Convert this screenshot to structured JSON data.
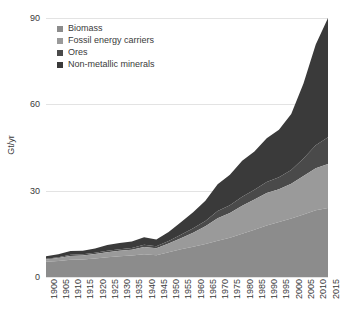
{
  "chart_data": {
    "type": "area",
    "stacked": true,
    "title": "",
    "xlabel": "",
    "ylabel": "Gt/yr",
    "ylim": [
      0,
      90
    ],
    "yticks": [
      0,
      30,
      60,
      90
    ],
    "xlim": [
      1900,
      2015
    ],
    "grid": true,
    "legend_position": "top-left",
    "x": [
      1900,
      1905,
      1910,
      1915,
      1920,
      1925,
      1930,
      1935,
      1940,
      1945,
      1950,
      1955,
      1960,
      1965,
      1970,
      1975,
      1980,
      1985,
      1990,
      1995,
      2000,
      2005,
      2010,
      2015
    ],
    "xticks": [
      "1900",
      "1905",
      "1910",
      "1915",
      "1920",
      "1925",
      "1930",
      "1935",
      "1940",
      "1945",
      "1950",
      "1955",
      "1960",
      "1965",
      "1970",
      "1975",
      "1980",
      "1985",
      "1990",
      "1995",
      "2000",
      "2005",
      "2010",
      "2015"
    ],
    "series": [
      {
        "name": "Biomass",
        "color": "#8c8c8c",
        "values": [
          5.3,
          5.6,
          6.0,
          6.1,
          6.4,
          6.9,
          7.2,
          7.5,
          7.9,
          7.6,
          8.6,
          9.6,
          10.5,
          11.5,
          12.6,
          13.6,
          15.0,
          16.4,
          17.9,
          19.1,
          20.3,
          21.7,
          23.2,
          24.0
        ]
      },
      {
        "name": "Fossil energy carriers",
        "color": "#9a9a9a",
        "values": [
          0.8,
          1.0,
          1.3,
          1.4,
          1.6,
          1.7,
          1.9,
          2.0,
          2.5,
          2.4,
          3.0,
          3.9,
          4.9,
          6.1,
          7.8,
          8.6,
          9.8,
          10.5,
          11.3,
          11.4,
          12.1,
          13.4,
          14.6,
          15.3
        ]
      },
      {
        "name": "Ores",
        "color": "#4a4a4a",
        "values": [
          0.2,
          0.3,
          0.4,
          0.4,
          0.4,
          0.5,
          0.5,
          0.6,
          0.8,
          0.7,
          0.9,
          1.2,
          1.5,
          1.9,
          2.5,
          2.7,
          3.1,
          3.4,
          3.8,
          4.2,
          4.8,
          6.1,
          8.0,
          9.3
        ]
      },
      {
        "name": "Non-metallic minerals",
        "color": "#3a3a3a",
        "values": [
          0.9,
          1.0,
          1.3,
          1.2,
          1.5,
          2.0,
          2.2,
          2.2,
          2.6,
          2.3,
          3.1,
          4.3,
          5.6,
          7.0,
          9.3,
          10.6,
          12.5,
          13.3,
          15.2,
          16.5,
          19.4,
          26.0,
          35.0,
          41.4
        ]
      }
    ],
    "totals": [
      7.2,
      7.9,
      9.0,
      9.1,
      9.9,
      11.1,
      11.8,
      12.3,
      13.8,
      13.0,
      15.6,
      19.0,
      22.5,
      26.5,
      32.2,
      35.5,
      40.4,
      43.6,
      48.2,
      51.2,
      56.6,
      67.2,
      80.8,
      90.0
    ]
  },
  "legend": {
    "items": [
      {
        "label": "Biomass"
      },
      {
        "label": "Fossil energy carriers"
      },
      {
        "label": "Ores"
      },
      {
        "label": "Non-metallic minerals"
      }
    ]
  }
}
